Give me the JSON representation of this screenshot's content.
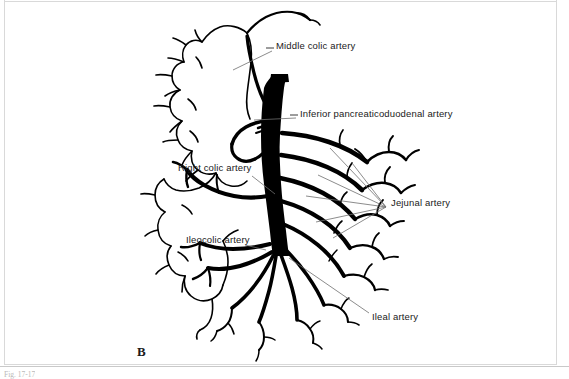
{
  "figure": {
    "panel_letter": "B",
    "caption_fragment": "Fig. 17-17",
    "background_color": "#ffffff",
    "ink_color": "#000000",
    "page_border_color": "#d7d7d7"
  },
  "annotations": [
    {
      "id": "middle-colic-artery",
      "label": "Middle colic artery",
      "label_x": 276,
      "label_y": 46,
      "leader": {
        "x1": 272,
        "y1": 51,
        "x2": 233,
        "y2": 70
      }
    },
    {
      "id": "inferior-pancreaticoduodenal-artery",
      "label": "Inferior pancreaticoduodenal artery",
      "label_x": 300,
      "label_y": 114,
      "leader": {
        "x1": 296,
        "y1": 118,
        "x2": 254,
        "y2": 120
      }
    },
    {
      "id": "right-colic-artery",
      "label": "Right colic artery",
      "label_x": 178,
      "label_y": 168,
      "leader": {
        "x1": 252,
        "y1": 176,
        "x2": 275,
        "y2": 194
      }
    },
    {
      "id": "ileocolic-artery",
      "label": "Ileocolic artery",
      "label_x": 186,
      "label_y": 240,
      "leader": {
        "x1": 245,
        "y1": 245,
        "x2": 266,
        "y2": 250
      }
    },
    {
      "id": "jejunal-artery",
      "label": "Jejunal artery",
      "label_x": 391,
      "label_y": 203,
      "leader_hub": {
        "x": 386,
        "y": 207
      },
      "leader_targets": [
        {
          "x": 330,
          "y": 148
        },
        {
          "x": 352,
          "y": 163
        },
        {
          "x": 318,
          "y": 175
        },
        {
          "x": 306,
          "y": 196
        },
        {
          "x": 316,
          "y": 222
        },
        {
          "x": 333,
          "y": 238
        }
      ]
    },
    {
      "id": "ileal-artery",
      "label": "Ileal artery",
      "label_x": 372,
      "label_y": 317,
      "leader": {
        "x1": 369,
        "y1": 313,
        "x2": 289,
        "y2": 258
      }
    }
  ],
  "structures": {
    "colon_outline": "large-intestine-outline",
    "sma_trunk": "superior-mesenteric-artery-trunk",
    "jejunal_branches": "jejunal-arterial-arcades",
    "ileal_branches": "ileal-arterial-arcades",
    "cecum": "cecum-and-appendix"
  }
}
